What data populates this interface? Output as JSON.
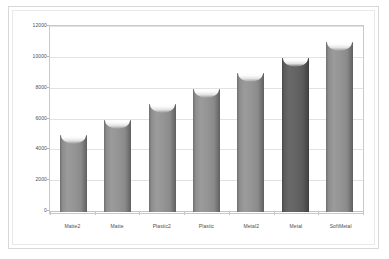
{
  "chart_data": {
    "type": "bar",
    "title": "",
    "subtitle": "",
    "xlabel": "",
    "ylabel": "",
    "categories": [
      "Matte2",
      "Matte",
      "Plastic2",
      "Plastic",
      "Metal2",
      "Metal",
      "SoftMetal"
    ],
    "values": [
      5000,
      6000,
      7000,
      8000,
      9000,
      10000,
      11000
    ],
    "ylim": [
      0,
      12000
    ],
    "yticks": [
      0,
      2000,
      4000,
      6000,
      8000,
      10000,
      12000
    ],
    "ytick_labels": [
      "0",
      "2000",
      "4000",
      "6000",
      "8000",
      "10000",
      "12000"
    ],
    "grid": true,
    "grid_axis": "y",
    "legend": false,
    "bar_colors": [
      "#949494",
      "#949494",
      "#949494",
      "#949494",
      "#949494",
      "#636363",
      "#949494"
    ],
    "highlight_index": 5,
    "colors": {
      "bar_fill": "#949494",
      "bar_fill_dark": "#636363",
      "bar_edge": "#5f5f5f",
      "gridline": "#e2e2e2",
      "axis_line": "#c9c9c9",
      "plot_background": "#ffffff",
      "panel_background": "#ffffff",
      "panel_border": "#d8d8d8",
      "tick_text": "#4d4d4d"
    }
  }
}
